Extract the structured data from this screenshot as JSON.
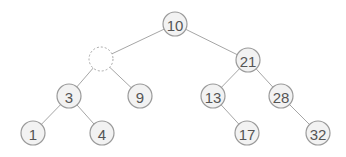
{
  "diagram": {
    "type": "binary-tree",
    "node_radius": 12,
    "colors": {
      "edge": "#a6a6a6",
      "node_fill": "#f2f2f2",
      "node_stroke": "#9a9a9a",
      "label": "#555555",
      "empty_stroke": "#a8a8a8"
    },
    "nodes": [
      {
        "id": "n10",
        "label": "10",
        "x": 175,
        "y": 24,
        "empty": false
      },
      {
        "id": "nEmpty",
        "label": "",
        "x": 101,
        "y": 59,
        "empty": true
      },
      {
        "id": "n21",
        "label": "21",
        "x": 248,
        "y": 60,
        "empty": false
      },
      {
        "id": "n3",
        "label": "3",
        "x": 69,
        "y": 96,
        "empty": false
      },
      {
        "id": "n9",
        "label": "9",
        "x": 140,
        "y": 96,
        "empty": false
      },
      {
        "id": "n13",
        "label": "13",
        "x": 213,
        "y": 96,
        "empty": false
      },
      {
        "id": "n28",
        "label": "28",
        "x": 281,
        "y": 96,
        "empty": false
      },
      {
        "id": "n1",
        "label": "1",
        "x": 33,
        "y": 133,
        "empty": false
      },
      {
        "id": "n4",
        "label": "4",
        "x": 102,
        "y": 133,
        "empty": false
      },
      {
        "id": "n17",
        "label": "17",
        "x": 247,
        "y": 133,
        "empty": false
      },
      {
        "id": "n32",
        "label": "32",
        "x": 318,
        "y": 133,
        "empty": false
      }
    ],
    "edges": [
      [
        "n10",
        "nEmpty"
      ],
      [
        "n10",
        "n21"
      ],
      [
        "nEmpty",
        "n3"
      ],
      [
        "nEmpty",
        "n9"
      ],
      [
        "n21",
        "n13"
      ],
      [
        "n21",
        "n28"
      ],
      [
        "n3",
        "n1"
      ],
      [
        "n3",
        "n4"
      ],
      [
        "n13",
        "n17"
      ],
      [
        "n28",
        "n32"
      ]
    ]
  }
}
